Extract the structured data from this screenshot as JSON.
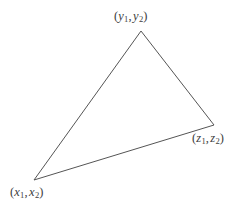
{
  "figure": {
    "type": "triangle-diagram",
    "background_color": "#ffffff",
    "stroke_color": "#555555",
    "stroke_width": 1,
    "text_color": "#3d3d3d",
    "width": 252,
    "height": 211
  },
  "vertices": [
    {
      "id": "y",
      "label_text": "(y1, y2)",
      "var": "y",
      "sub1": "1",
      "sub2": "2",
      "open_paren": "(",
      "close_paren": ")",
      "comma": ",",
      "point": {
        "x": 141,
        "y": 31
      },
      "position": "top"
    },
    {
      "id": "z",
      "label_text": "(z1, z2)",
      "var": "z",
      "sub1": "1",
      "sub2": "2",
      "open_paren": "(",
      "close_paren": ")",
      "comma": ",",
      "point": {
        "x": 214,
        "y": 125
      },
      "position": "right"
    },
    {
      "id": "x",
      "label_text": "(x1, x2)",
      "var": "x",
      "sub1": "1",
      "sub2": "2",
      "open_paren": "(",
      "close_paren": ")",
      "comma": ",",
      "point": {
        "x": 34,
        "y": 180
      },
      "position": "bottom-left"
    }
  ],
  "edges": [
    {
      "from": "x",
      "to": "y"
    },
    {
      "from": "y",
      "to": "z"
    },
    {
      "from": "z",
      "to": "x"
    }
  ],
  "polygon_points": "141,31 214,125 34,180"
}
